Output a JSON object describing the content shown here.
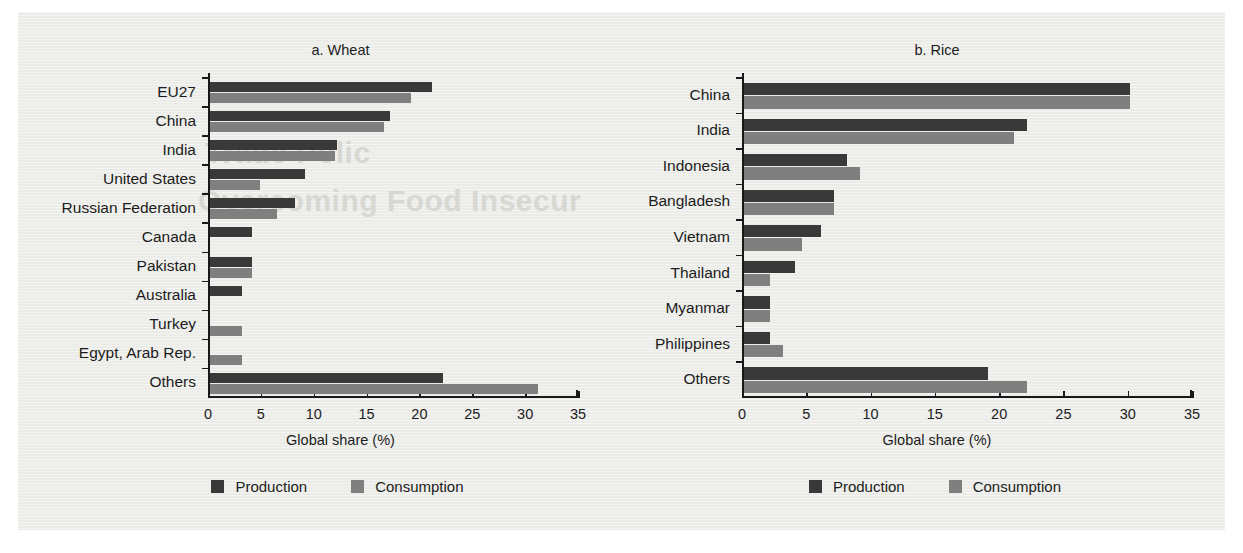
{
  "figure": {
    "axis_title": "Global share (%)",
    "legend": [
      {
        "label": "Production",
        "color": "#393939",
        "key": "production"
      },
      {
        "label": "Consumption",
        "color": "#7f7f7f",
        "key": "consumption"
      }
    ],
    "watermark_lines": [
      "Trade Polic",
      "Overcoming Food Insecur"
    ]
  },
  "chart_data": [
    {
      "type": "bar",
      "orientation": "horizontal",
      "title": "a.  Wheat",
      "xlabel": "Global share (%)",
      "ylabel": "",
      "xlim": [
        0,
        35
      ],
      "xticks": [
        0,
        5,
        10,
        15,
        20,
        25,
        30,
        35
      ],
      "xticklabels": [
        "0",
        "5",
        "10",
        "15",
        "20",
        "25",
        "30",
        "35"
      ],
      "grid": false,
      "legend_position": "bottom",
      "categories": [
        "EU27",
        "China",
        "India",
        "United States",
        "Russian Federation",
        "Canada",
        "Pakistan",
        "Australia",
        "Turkey",
        "Egypt, Arab Rep.",
        "Others"
      ],
      "series": [
        {
          "name": "Production",
          "color": "#393939",
          "values": [
            21,
            17,
            12,
            9,
            8,
            4,
            4,
            3,
            0,
            0,
            22
          ]
        },
        {
          "name": "Consumption",
          "color": "#7f7f7f",
          "values": [
            19,
            16.5,
            11.8,
            4.7,
            6.3,
            0,
            4,
            0,
            3,
            3,
            31
          ]
        }
      ]
    },
    {
      "type": "bar",
      "orientation": "horizontal",
      "title": "b.  Rice",
      "xlabel": "Global share (%)",
      "ylabel": "",
      "xlim": [
        0,
        35
      ],
      "xticks": [
        0,
        5,
        10,
        15,
        20,
        25,
        30,
        35
      ],
      "xticklabels": [
        "0",
        "5",
        "10",
        "15",
        "20",
        "25",
        "30",
        "35"
      ],
      "grid": false,
      "legend_position": "bottom",
      "categories": [
        "China",
        "India",
        "Indonesia",
        "Bangladesh",
        "Vietnam",
        "Thailand",
        "Myanmar",
        "Philippines",
        "Others"
      ],
      "series": [
        {
          "name": "Production",
          "color": "#393939",
          "values": [
            30,
            22,
            8,
            7,
            6,
            4,
            2,
            2,
            19
          ]
        },
        {
          "name": "Consumption",
          "color": "#7f7f7f",
          "values": [
            30,
            21,
            9,
            7,
            4.5,
            2,
            2,
            3,
            22
          ]
        }
      ]
    }
  ]
}
